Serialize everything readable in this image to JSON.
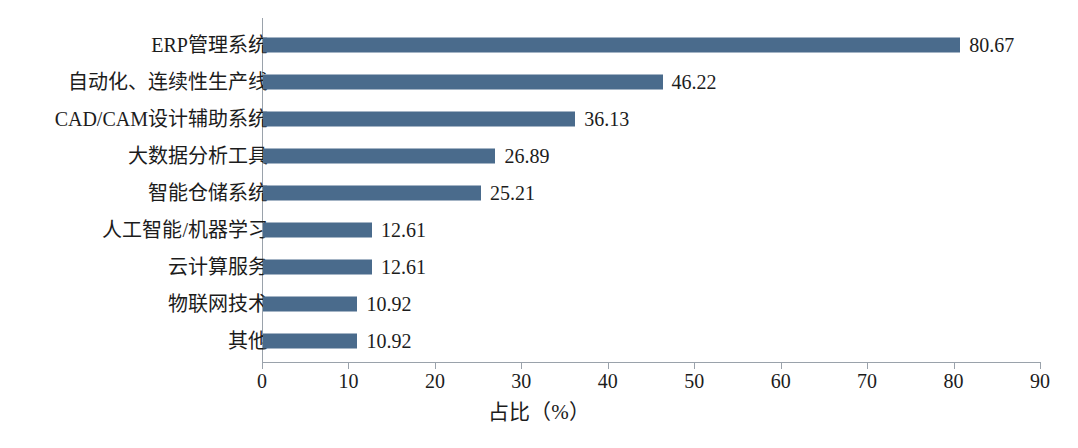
{
  "chart_data": {
    "type": "bar",
    "orientation": "horizontal",
    "title": "",
    "subtitle": "",
    "xlabel": "占比（%）",
    "ylabel": "",
    "xlim": [
      0,
      90
    ],
    "xticks": [
      0,
      10,
      20,
      30,
      40,
      50,
      60,
      70,
      80,
      90
    ],
    "xtick_labels": [
      "0",
      "10",
      "20",
      "30",
      "40",
      "50",
      "60",
      "70",
      "80",
      "90"
    ],
    "grid": false,
    "legend": null,
    "bar_color": "#4a6b8c",
    "axis_color": "#9aa2ab",
    "text_color": "#1c1c1c",
    "background": "#ffffff",
    "categories": [
      "ERP管理系统",
      "自动化、连续性生产线",
      "CAD/CAM设计辅助系统",
      "大数据分析工具",
      "智能仓储系统",
      "人工智能/机器学习",
      "云计算服务",
      "物联网技术",
      "其他"
    ],
    "values": [
      80.67,
      46.22,
      36.13,
      26.89,
      25.21,
      12.61,
      12.61,
      10.92,
      10.92
    ],
    "value_labels": [
      "80.67",
      "46.22",
      "36.13",
      "26.89",
      "25.21",
      "12.61",
      "12.61",
      "10.92",
      "10.92"
    ]
  }
}
